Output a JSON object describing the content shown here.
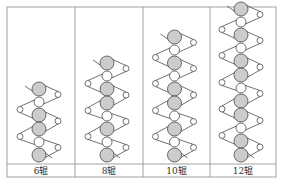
{
  "colors": {
    "frame": "#8a8a8a",
    "stroke": "#333333",
    "large_roll_fill": "#cccccc",
    "small_roll_fill": "#ffffff"
  },
  "panels": [
    {
      "label": "6辊",
      "roll_count": 6,
      "sequence": [
        "L",
        "S",
        "L",
        "L",
        "S",
        "L"
      ]
    },
    {
      "label": "8辊",
      "roll_count": 8,
      "sequence": [
        "L",
        "S",
        "L",
        "L",
        "S",
        "L",
        "S",
        "L"
      ]
    },
    {
      "label": "10辊",
      "roll_count": 10,
      "sequence": [
        "L",
        "S",
        "L",
        "S",
        "L",
        "L",
        "S",
        "L",
        "S",
        "L"
      ]
    },
    {
      "label": "12辊",
      "roll_count": 12,
      "sequence": [
        "L",
        "S",
        "L",
        "S",
        "L",
        "L",
        "S",
        "L",
        "L",
        "S",
        "L",
        "L"
      ]
    }
  ]
}
